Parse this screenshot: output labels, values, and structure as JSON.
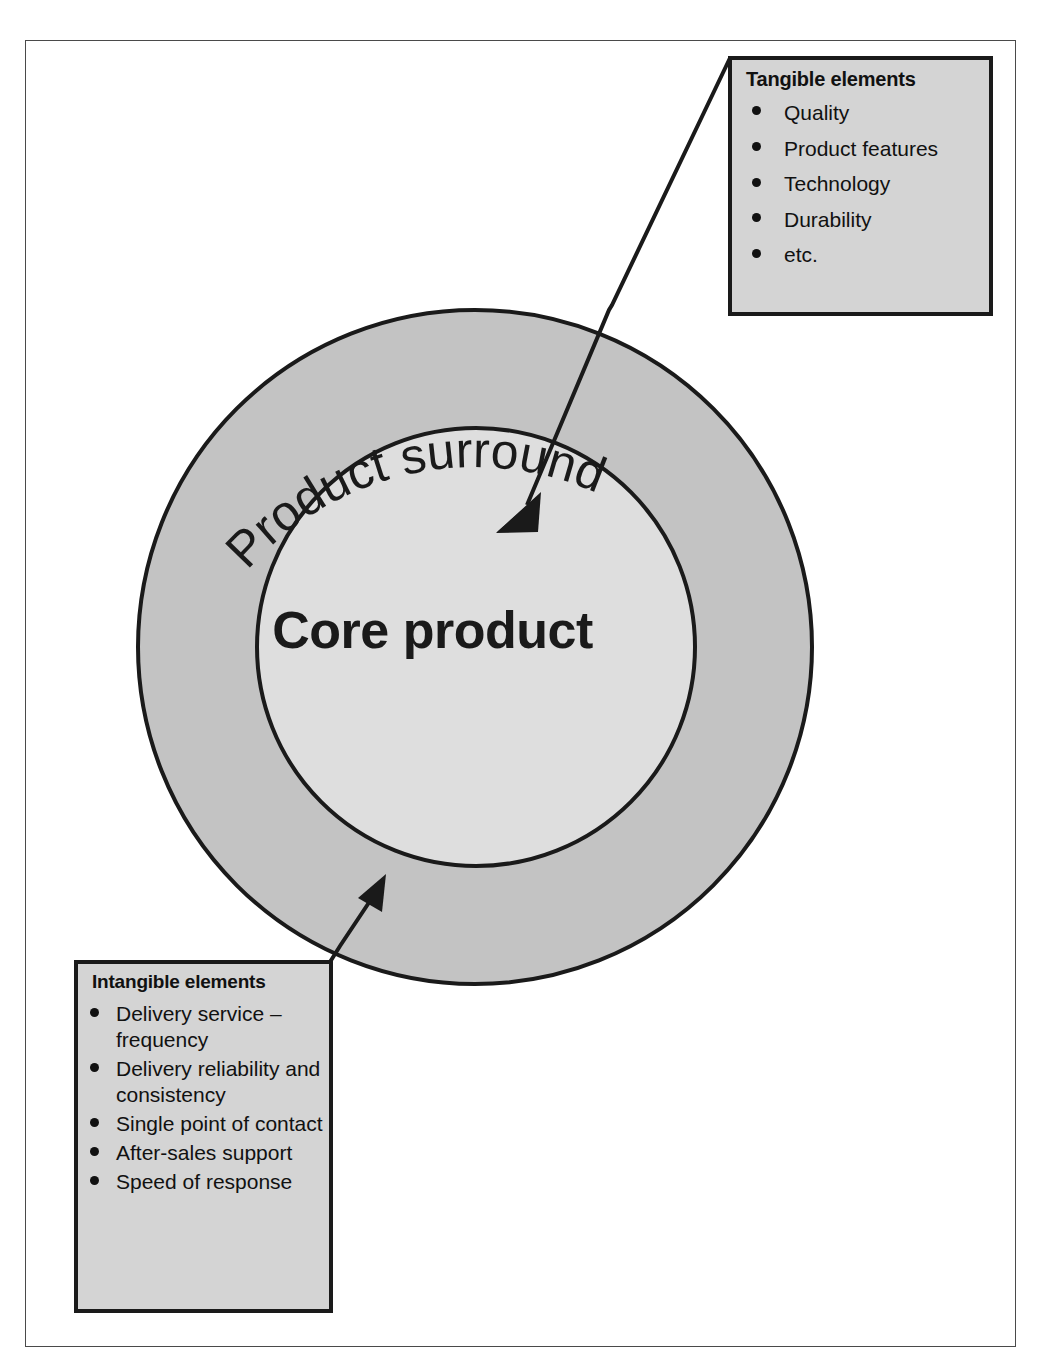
{
  "diagram": {
    "title_core": "Core product",
    "title_surround": "Product surround",
    "colors": {
      "surround_ring": "#c3c3c3",
      "core_fill": "#dedede",
      "box_fill": "#d4d4d4",
      "stroke": "#1a1a1a",
      "page_frame": "#4a4a4a"
    }
  },
  "tangible_box": {
    "title": "Tangible elements",
    "items": [
      "Quality",
      "Product features",
      "Technology",
      "Durability",
      "etc."
    ]
  },
  "intangible_box": {
    "title": "Intangible elements",
    "items": [
      "Delivery service – frequency",
      "Delivery reliability and consistency",
      "Single point of contact",
      "After-sales support",
      "Speed of response"
    ]
  },
  "connectors": [
    {
      "name": "tangible-to-core",
      "from": "tangible-box-top-left",
      "to": "core-product-circle"
    },
    {
      "name": "intangible-to-surround",
      "from": "intangible-box-top-right",
      "to": "product-surround-ring"
    }
  ]
}
